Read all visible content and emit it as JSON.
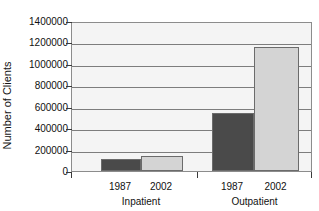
{
  "chart_data": {
    "type": "bar",
    "title": "",
    "xlabel": "",
    "ylabel": "Number of Clients",
    "ylim": [
      0,
      1400000
    ],
    "yticks": [
      0,
      200000,
      400000,
      600000,
      800000,
      1000000,
      1200000,
      1400000
    ],
    "ytick_labels": [
      "0",
      "200000",
      "400000",
      "600000",
      "800000",
      "1000000",
      "1200000",
      "1400000"
    ],
    "grid": true,
    "legend": null,
    "groups": [
      "Inpatient",
      "Outpatient"
    ],
    "categories": [
      "1987",
      "2002"
    ],
    "series": [
      {
        "name": "1987",
        "values": [
          112000,
          540000
        ],
        "color": "#4a4a4a"
      },
      {
        "name": "2002",
        "values": [
          140000,
          1160000
        ],
        "color": "#d4d4d4"
      }
    ],
    "bars": [
      {
        "group": "Inpatient",
        "year": "1987",
        "value": 112000,
        "color": "#4a4a4a"
      },
      {
        "group": "Inpatient",
        "year": "2002",
        "value": 140000,
        "color": "#d4d4d4"
      },
      {
        "group": "Outpatient",
        "year": "1987",
        "value": 540000,
        "color": "#4a4a4a"
      },
      {
        "group": "Outpatient",
        "year": "2002",
        "value": 1160000,
        "color": "#d4d4d4"
      }
    ],
    "colors": {
      "dark_bar": "#4a4a4a",
      "light_bar": "#d4d4d4",
      "plot_background": "#f4f4f4",
      "gridline": "#7d7d7d",
      "axis": "#3a3a3a",
      "text": "#111111"
    }
  },
  "axis": {
    "y_title": "Number of Clients"
  },
  "x_labels": {
    "years": [
      "1987",
      "2002",
      "1987",
      "2002"
    ],
    "groups": [
      "Inpatient",
      "Outpatient"
    ]
  }
}
